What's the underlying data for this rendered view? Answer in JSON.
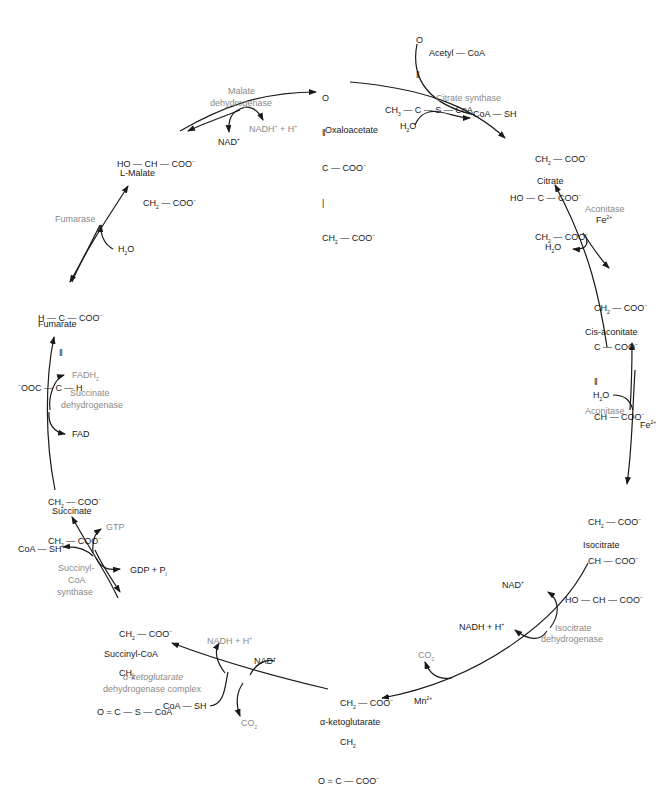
{
  "diagram": {
    "molecules": {
      "acetyl_coa": {
        "name": "Acetyl — CoA",
        "formula": [
          "O",
          "||",
          "CH3 — C — S — CoA"
        ]
      },
      "oxaloacetate": {
        "name": "Oxaloacetate",
        "formula": [
          "O",
          "||",
          "C — COO⁻",
          "|",
          "CH2 — COO⁻"
        ]
      },
      "citrate": {
        "name": "Citrate",
        "formula": [
          "CH2 — COO⁻",
          "HO — C — COO⁻",
          "CH2 — COO⁻"
        ]
      },
      "cis_aconitate": {
        "name": "Cis-aconitate",
        "formula": [
          "CH2 — COO⁻",
          "C — COO⁻",
          "||",
          "CH — COO⁻"
        ]
      },
      "isocitrate": {
        "name": "Isocitrate",
        "formula": [
          "CH2 — COO⁻",
          "CH — COO⁻",
          "HO — CH — COO⁻"
        ]
      },
      "alpha_ketoglutarate": {
        "name": "α-ketoglutarate",
        "formula": [
          "CH2 — COO⁻",
          "CH2",
          "O = C — COO⁻"
        ]
      },
      "succinyl_coa": {
        "name": "Succinyl-CoA",
        "formula": [
          "CH2 — COO⁻",
          "CH2",
          "O = C — S — CoA"
        ]
      },
      "succinate": {
        "name": "Succinate",
        "formula": [
          "CH2 — COO⁻",
          "CH2 — COO⁻"
        ]
      },
      "fumarate": {
        "name": "Fumarate",
        "formula": [
          "H — C — COO⁻",
          "||",
          "⁻OOC — C — H"
        ]
      },
      "l_malate": {
        "name": "L-Malate",
        "formula": [
          "HO — CH — COO⁻",
          "CH2 — COO⁻"
        ]
      }
    },
    "enzymes": {
      "citrate_synthase": "Citrate synthase",
      "aconitase_1": "Aconitase",
      "aconitase_2": "Aconitase",
      "isocitrate_dh_1": "Isocitrate",
      "isocitrate_dh_2": "dehydrogenase",
      "akg_dh_1": "α-ketoglutarate",
      "akg_dh_2": "dehydrogenase complex",
      "succinyl_coa_synthase_1": "Succinyl-",
      "succinyl_coa_synthase_2": "CoA",
      "succinyl_coa_synthase_3": "synthase",
      "succinate_dh_1": "Succinate",
      "succinate_dh_2": "dehydrogenase",
      "fumarase": "Fumarase",
      "malate_dh_1": "Malate",
      "malate_dh_2": "dehydrogenase"
    },
    "cofactors": {
      "citrate_synthase_h2o": "H2O",
      "citrate_synthase_coash": "CoA — SH",
      "aconitase_fe_1": "Fe2+",
      "aconitase_h2o_1": "H2O",
      "aconitase_h2o_2": "H2O",
      "aconitase_fe_2": "Fe2+",
      "icdh_nad": "NAD+",
      "icdh_nadh": "NADH + H+",
      "icdh_co2": "CO2",
      "icdh_mn": "Mn2+",
      "akgdh_nadh": "NADH + H+",
      "akgdh_nad": "NAD+",
      "akgdh_coash": "CoA — SH",
      "akgdh_co2": "CO2",
      "scs_gtp": "GTP",
      "scs_coash": "CoA — SH",
      "scs_gdp": "GDP + Pi",
      "sdh_fadh2": "FADH2",
      "sdh_fad": "FAD",
      "fumarase_h2o": "H2O",
      "mdh_nad": "NAD+",
      "mdh_nadh": "NADH+ + H+"
    },
    "colors": {
      "text": "#1a1a1a",
      "enzyme_text": "#8a8a8a",
      "arrow": "#1a1a1a"
    }
  }
}
